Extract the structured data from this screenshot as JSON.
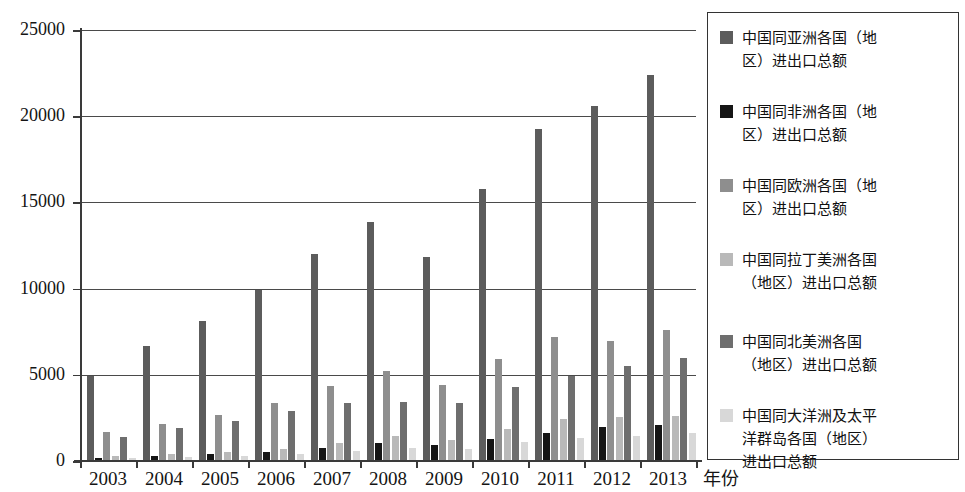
{
  "chart_data": {
    "type": "bar",
    "title": "",
    "xlabel": "年份",
    "ylabel": "",
    "ylim": [
      0,
      25000
    ],
    "ytick_values": [
      0,
      5000,
      10000,
      15000,
      20000,
      25000
    ],
    "ytick_labels": [
      "0",
      "5000",
      "10000",
      "15000",
      "20000",
      "25000"
    ],
    "grid": true,
    "legend_position": "right",
    "categories": [
      "2003",
      "2004",
      "2005",
      "2006",
      "2007",
      "2008",
      "2009",
      "2010",
      "2011",
      "2012",
      "2013"
    ],
    "series": [
      {
        "name": "中国同亚洲各国（地区）进出口总额",
        "color": "#5c5c5c",
        "values": [
          4950,
          6700,
          8150,
          9900,
          12000,
          13850,
          11850,
          15750,
          19250,
          20600,
          22400
        ]
      },
      {
        "name": "中国同非洲各国（地区）进出口总额",
        "color": "#151515",
        "values": [
          190,
          290,
          400,
          550,
          730,
          1070,
          910,
          1270,
          1630,
          1990,
          2100
        ]
      },
      {
        "name": "中国同欧洲各国（地区）进出口总额",
        "color": "#8e8e8e",
        "values": [
          1700,
          2150,
          2650,
          3350,
          4350,
          5250,
          4400,
          5900,
          7200,
          6950,
          7600
        ]
      },
      {
        "name": "中国同拉丁美洲各国（地区）进出口总额",
        "color": "#b9b9b9",
        "values": [
          270,
          400,
          500,
          700,
          1020,
          1430,
          1220,
          1830,
          2410,
          2570,
          2620
        ]
      },
      {
        "name": "中国同北美洲各国（地区）进出口总额",
        "color": "#6e6e6e",
        "values": [
          1400,
          1900,
          2300,
          2900,
          3350,
          3450,
          3350,
          4300,
          4950,
          5500,
          6000
        ]
      },
      {
        "name": "中国同大洋洲及太平洋群岛各国（地区）进出口总额",
        "color": "#d8d8d8",
        "values": [
          150,
          230,
          290,
          400,
          580,
          750,
          700,
          1080,
          1330,
          1440,
          1620
        ]
      }
    ]
  },
  "legend": {
    "items": [
      {
        "label": "中国同亚洲各国（地\n区）进出口总额",
        "color": "#5c5c5c"
      },
      {
        "label": "中国同非洲各国（地\n区）进出口总额",
        "color": "#151515"
      },
      {
        "label": "中国同欧洲各国（地\n区）进出口总额",
        "color": "#8e8e8e"
      },
      {
        "label": "中国同拉丁美洲各国\n（地区）进出口总额",
        "color": "#b9b9b9"
      },
      {
        "label": "中国同北美洲各国\n（地区）进出口总额",
        "color": "#6e6e6e"
      },
      {
        "label": "中国同大洋洲及太平\n洋群岛各国（地区）\n进出口总额",
        "color": "#d8d8d8"
      }
    ]
  }
}
